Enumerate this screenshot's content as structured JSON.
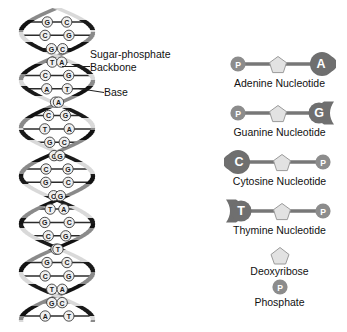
{
  "figure": {
    "background_color": "#ffffff"
  },
  "helix": {
    "name": "DNA double helix",
    "callouts": [
      {
        "id": "backbone",
        "line1": "Sugar-phosphate",
        "line2": "Backbone"
      },
      {
        "id": "base",
        "line1": "Base",
        "line2": ""
      }
    ],
    "base_pairs": [
      [
        "G",
        "C"
      ],
      [
        "C",
        "G"
      ],
      [
        "G",
        "C"
      ],
      [
        "T",
        "A"
      ],
      [
        "C",
        "G"
      ],
      [
        "A",
        "T"
      ],
      [
        "T",
        "A"
      ],
      [
        "C",
        "G"
      ],
      [
        "T",
        "A"
      ],
      [
        "G",
        "C"
      ],
      [
        "C",
        "G"
      ],
      [
        "C",
        "G"
      ],
      [
        "G",
        "C"
      ],
      [
        "C",
        "G"
      ],
      [
        "T",
        "A"
      ],
      [
        "G",
        "C"
      ],
      [
        "C",
        "G"
      ],
      [
        "A",
        "T"
      ],
      [
        "G",
        "C"
      ],
      [
        "C",
        "G"
      ],
      [
        "T",
        "A"
      ],
      [
        "G",
        "C"
      ],
      [
        "A",
        "T"
      ]
    ],
    "colors": {
      "ribbon_light": "#d9d9d9",
      "ribbon_dark": "#1a1a1a",
      "rung": "#2b2b2b",
      "base_circle_fill": "#efefef",
      "base_circle_stroke": "#3a3a3a"
    }
  },
  "key": {
    "nucleotides": [
      {
        "id": "adenine",
        "letter": "A",
        "label": "Adenine Nucleotide",
        "base_shape": "knob-right",
        "base_side": "right",
        "phosphate_side": "left",
        "phosphate_letter": "P"
      },
      {
        "id": "guanine",
        "letter": "G",
        "label": "Guanine Nucleotide",
        "base_shape": "notch-right",
        "base_side": "right",
        "phosphate_side": "left",
        "phosphate_letter": "P"
      },
      {
        "id": "cytosine",
        "letter": "C",
        "label": "Cytosine Nucleotide",
        "base_shape": "knob-left",
        "base_side": "left",
        "phosphate_side": "right",
        "phosphate_letter": "P"
      },
      {
        "id": "thymine",
        "letter": "T",
        "label": "Thymine Nucleotide",
        "base_shape": "notch-left",
        "base_side": "left",
        "phosphate_side": "right",
        "phosphate_letter": "P"
      }
    ],
    "legend": [
      {
        "id": "deoxyribose",
        "label": "Deoxyribose",
        "glyph": "pentagon",
        "letter": ""
      },
      {
        "id": "phosphate",
        "label": "Phosphate",
        "glyph": "circle",
        "letter": "P"
      }
    ],
    "colors": {
      "base_fill": "#6f6f6f",
      "base_text": "#ffffff",
      "sugar_fill": "#e2e2e2",
      "sugar_stroke": "#9a9a9a",
      "phosphate_fill": "#8c8c8c",
      "phosphate_text": "#ffffff",
      "bond": "#777777"
    }
  }
}
